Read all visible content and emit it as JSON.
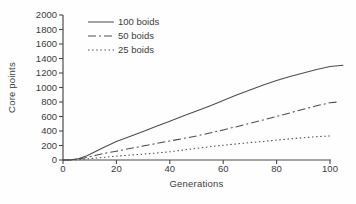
{
  "figure": {
    "background": "#fefefe",
    "axis_color": "#4a4a4a",
    "text_color": "#3b3b3b"
  },
  "chart_data": {
    "type": "line",
    "title": "",
    "xlabel": "Generations",
    "ylabel": "Core points",
    "xlim": [
      0,
      105
    ],
    "ylim": [
      0,
      2000
    ],
    "x_ticks": [
      0,
      20,
      40,
      60,
      80,
      100
    ],
    "y_ticks": [
      0,
      200,
      400,
      600,
      800,
      1000,
      1200,
      1400,
      1600,
      1800,
      2000
    ],
    "grid": false,
    "legend_position": "top-left-inside",
    "line_color": "#4d4d4d",
    "series": [
      {
        "name": "100 boids",
        "style": "solid",
        "points": [
          [
            0,
            0
          ],
          [
            3,
            3
          ],
          [
            6,
            20
          ],
          [
            9,
            60
          ],
          [
            12,
            115
          ],
          [
            15,
            170
          ],
          [
            20,
            255
          ],
          [
            25,
            325
          ],
          [
            30,
            395
          ],
          [
            35,
            465
          ],
          [
            40,
            535
          ],
          [
            45,
            605
          ],
          [
            50,
            675
          ],
          [
            55,
            745
          ],
          [
            60,
            820
          ],
          [
            65,
            895
          ],
          [
            70,
            965
          ],
          [
            75,
            1035
          ],
          [
            80,
            1095
          ],
          [
            85,
            1150
          ],
          [
            90,
            1200
          ],
          [
            95,
            1248
          ],
          [
            100,
            1288
          ],
          [
            105,
            1308
          ]
        ]
      },
      {
        "name": "50 boids",
        "style": "dash-dot",
        "points": [
          [
            0,
            0
          ],
          [
            3,
            2
          ],
          [
            6,
            12
          ],
          [
            9,
            35
          ],
          [
            12,
            62
          ],
          [
            15,
            88
          ],
          [
            20,
            122
          ],
          [
            25,
            157
          ],
          [
            30,
            192
          ],
          [
            35,
            227
          ],
          [
            40,
            262
          ],
          [
            45,
            297
          ],
          [
            50,
            333
          ],
          [
            55,
            372
          ],
          [
            60,
            415
          ],
          [
            65,
            460
          ],
          [
            70,
            506
          ],
          [
            75,
            552
          ],
          [
            80,
            600
          ],
          [
            85,
            650
          ],
          [
            90,
            700
          ],
          [
            95,
            748
          ],
          [
            100,
            790
          ],
          [
            103,
            800
          ]
        ]
      },
      {
        "name": "25 boids",
        "style": "dotted",
        "points": [
          [
            0,
            0
          ],
          [
            3,
            1
          ],
          [
            6,
            6
          ],
          [
            9,
            15
          ],
          [
            12,
            26
          ],
          [
            15,
            36
          ],
          [
            20,
            52
          ],
          [
            25,
            67
          ],
          [
            30,
            82
          ],
          [
            35,
            97
          ],
          [
            40,
            113
          ],
          [
            45,
            136
          ],
          [
            50,
            160
          ],
          [
            55,
            184
          ],
          [
            60,
            204
          ],
          [
            65,
            222
          ],
          [
            70,
            240
          ],
          [
            75,
            257
          ],
          [
            80,
            274
          ],
          [
            85,
            291
          ],
          [
            90,
            307
          ],
          [
            95,
            321
          ],
          [
            100,
            333
          ]
        ]
      }
    ]
  }
}
